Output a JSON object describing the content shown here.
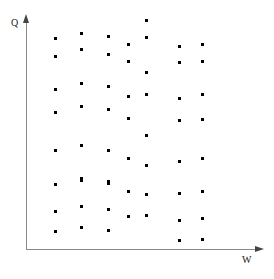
{
  "chart_data": {
    "type": "scatter",
    "title": "",
    "xlabel": "W",
    "ylabel": "Q",
    "grid": false,
    "legend": null,
    "axis_style": "arrow",
    "xlim": [
      0,
      232
    ],
    "ylim": [
      0,
      228
    ],
    "marker": "square",
    "marker_color": "#000000",
    "marker_size_px": 3,
    "point_count": 62,
    "note": "Positive correlation-free cloud of discrete points arranged in vertical bands; values read off pixel positions relative to the arrow axes (origin at lower-left).",
    "columns_x": [
      55.6,
      81.3,
      108.3,
      128.6,
      146.6,
      179.3,
      202.6
    ],
    "points": [
      {
        "x": 55.6,
        "y": 38.3
      },
      {
        "x": 55.6,
        "y": 56.6
      },
      {
        "x": 55.6,
        "y": 89.0
      },
      {
        "x": 55.6,
        "y": 112.3
      },
      {
        "x": 55.6,
        "y": 150.6
      },
      {
        "x": 55.6,
        "y": 184.3
      },
      {
        "x": 55.6,
        "y": 211.6
      },
      {
        "x": 55.6,
        "y": 231.6
      },
      {
        "x": 81.3,
        "y": 33.3
      },
      {
        "x": 81.3,
        "y": 49.3
      },
      {
        "x": 81.3,
        "y": 83.3
      },
      {
        "x": 81.3,
        "y": 106.6
      },
      {
        "x": 81.3,
        "y": 145.0
      },
      {
        "x": 81.3,
        "y": 178.3
      },
      {
        "x": 81.3,
        "y": 180.6
      },
      {
        "x": 81.3,
        "y": 206.6
      },
      {
        "x": 81.3,
        "y": 227.6
      },
      {
        "x": 108.3,
        "y": 36.6
      },
      {
        "x": 108.3,
        "y": 54.0
      },
      {
        "x": 108.3,
        "y": 86.0
      },
      {
        "x": 108.3,
        "y": 109.3
      },
      {
        "x": 108.3,
        "y": 150.6
      },
      {
        "x": 108.3,
        "y": 181.6
      },
      {
        "x": 108.3,
        "y": 183.3
      },
      {
        "x": 108.3,
        "y": 209.3
      },
      {
        "x": 108.3,
        "y": 230.0
      },
      {
        "x": 128.6,
        "y": 44.3
      },
      {
        "x": 128.6,
        "y": 61.6
      },
      {
        "x": 128.6,
        "y": 96.0
      },
      {
        "x": 128.6,
        "y": 118.6
      },
      {
        "x": 128.6,
        "y": 158.3
      },
      {
        "x": 128.6,
        "y": 191.6
      },
      {
        "x": 128.6,
        "y": 216.6
      },
      {
        "x": 146.6,
        "y": 20.0
      },
      {
        "x": 146.6,
        "y": 37.6
      },
      {
        "x": 146.6,
        "y": 72.6
      },
      {
        "x": 146.6,
        "y": 94.0
      },
      {
        "x": 146.6,
        "y": 135.0
      },
      {
        "x": 146.6,
        "y": 165.0
      },
      {
        "x": 146.6,
        "y": 194.0
      },
      {
        "x": 146.6,
        "y": 215.0
      },
      {
        "x": 179.3,
        "y": 46.6
      },
      {
        "x": 179.3,
        "y": 62.6
      },
      {
        "x": 179.3,
        "y": 98.3
      },
      {
        "x": 179.3,
        "y": 120.6
      },
      {
        "x": 179.3,
        "y": 161.6
      },
      {
        "x": 179.3,
        "y": 193.3
      },
      {
        "x": 179.3,
        "y": 220.6
      },
      {
        "x": 179.3,
        "y": 240.6
      },
      {
        "x": 202.6,
        "y": 44.3
      },
      {
        "x": 202.6,
        "y": 61.6
      },
      {
        "x": 202.6,
        "y": 94.0
      },
      {
        "x": 202.6,
        "y": 119.3
      },
      {
        "x": 202.6,
        "y": 158.3
      },
      {
        "x": 202.6,
        "y": 191.6
      },
      {
        "x": 202.6,
        "y": 218.3
      },
      {
        "x": 202.6,
        "y": 239.3
      }
    ]
  },
  "axes": {
    "y": {
      "label": "Q",
      "origin_px": {
        "x": 26,
        "y": 249
      },
      "end_px": {
        "x": 26,
        "y": 18
      },
      "color": "#8a8a8a"
    },
    "x": {
      "label": "W",
      "origin_px": {
        "x": 26,
        "y": 249
      },
      "end_px": {
        "x": 258,
        "y": 249
      },
      "color": "#8a8a8a"
    }
  },
  "icons": {
    "y_arrow": "arrow-up-icon",
    "x_arrow": "arrow-right-icon"
  },
  "canvas": {
    "width": 274,
    "height": 279,
    "background": "#ffffff"
  }
}
